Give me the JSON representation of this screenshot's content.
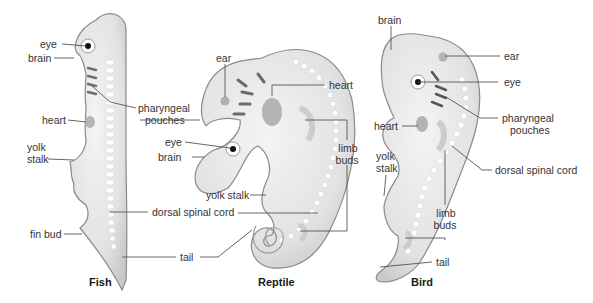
{
  "figure": {
    "colors": {
      "embryo_fill": "#e4e4e4",
      "embryo_shade": "#bdbdbd",
      "outline": "#8a8a8a",
      "pouch": "#7a7a7a",
      "leader_line": "#555555",
      "label_text": "#333333"
    }
  },
  "panels": [
    {
      "caption": "Fish",
      "labels": {
        "eye": "eye",
        "brain": "brain",
        "pharyngeal": "pharyngeal",
        "pouches": "pouches",
        "heart": "heart",
        "yolk": "yolk",
        "stalk": "stalk",
        "fin_bud": "fin bud"
      }
    },
    {
      "caption": "Reptile",
      "labels": {
        "ear": "ear",
        "heart": "heart",
        "eye": "eye",
        "brain": "brain",
        "limb": "limb",
        "buds": "buds",
        "yolk_stalk": "yolk stalk"
      }
    },
    {
      "caption": "Bird",
      "labels": {
        "brain": "brain",
        "ear": "ear",
        "eye": "eye",
        "pharyngeal": "pharyngeal",
        "pouches": "pouches",
        "heart": "heart",
        "yolk": "yolk",
        "stalk": "stalk",
        "dorsal_spinal_cord": "dorsal spinal cord",
        "limb": "limb",
        "buds": "buds",
        "tail": "tail"
      }
    }
  ],
  "shared_labels": {
    "dorsal_spinal_cord": "dorsal spinal cord",
    "tail": "tail"
  }
}
